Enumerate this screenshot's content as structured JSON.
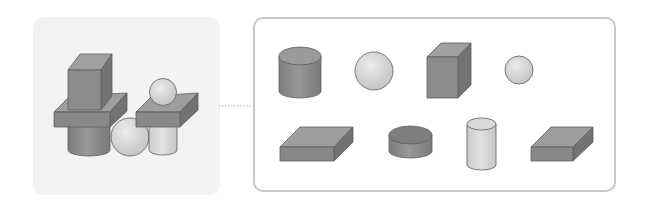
{
  "figure": {
    "type": "shape-composition-diagram",
    "composite_panel": {
      "label": "Composite structure",
      "shapes": [
        "cube",
        "slab",
        "cylinder",
        "sphere",
        "slab",
        "sphere",
        "cylinder"
      ]
    },
    "connector": {
      "style": "dotted"
    },
    "parts_panel": {
      "label": "Component shapes",
      "rows": [
        [
          "cylinder",
          "sphere",
          "cube",
          "small-sphere"
        ],
        [
          "slab",
          "disc",
          "small-cylinder",
          "slab"
        ]
      ]
    },
    "colors": {
      "dark_solid": "#8a8a8a",
      "dark_top": "#9e9e9e",
      "dark_side": "#727272",
      "light_solid": "#d6d6d6",
      "panel_bg": "#f3f3f3",
      "panel_border": "#c8c8c8",
      "outline": "#5e5e5e"
    }
  }
}
